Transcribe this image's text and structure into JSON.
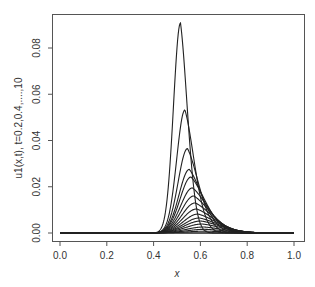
{
  "chart_data": {
    "type": "line",
    "title": "",
    "xlabel": "x",
    "ylabel": "u1(x,t), t=0.2,0.4,....,10",
    "xlim": [
      0,
      1
    ],
    "ylim": [
      0,
      0.092
    ],
    "grid": false,
    "legend": null,
    "x_ticks": [
      "0.0",
      "0.2",
      "0.4",
      "0.6",
      "0.8",
      "1.0"
    ],
    "y_ticks": [
      "0.00",
      "0.02",
      "0.04",
      "0.06",
      "0.08"
    ],
    "line_color": "#222222",
    "series_note": "Family of curves for t = 0.2, 0.4, ..., 10; peak amplitude decreases and peak shifts right as t increases",
    "series": [
      {
        "name": "t=0.2",
        "peak_x": 0.515,
        "peak_y": 0.0908,
        "rise": 0.03,
        "decay": 0.03
      },
      {
        "name": "t=0.4",
        "peak_x": 0.534,
        "peak_y": 0.0532,
        "rise": 0.035,
        "decay": 0.04
      },
      {
        "name": "t=0.6",
        "peak_x": 0.545,
        "peak_y": 0.0365,
        "rise": 0.04,
        "decay": 0.048
      },
      {
        "name": "t=0.8",
        "peak_x": 0.553,
        "peak_y": 0.0275,
        "rise": 0.044,
        "decay": 0.055
      },
      {
        "name": "t=1.0",
        "peak_x": 0.56,
        "peak_y": 0.0242,
        "rise": 0.047,
        "decay": 0.06
      },
      {
        "name": "t=1.2",
        "peak_x": 0.566,
        "peak_y": 0.0195,
        "rise": 0.05,
        "decay": 0.065
      },
      {
        "name": "t=1.4",
        "peak_x": 0.572,
        "peak_y": 0.016,
        "rise": 0.053,
        "decay": 0.069
      },
      {
        "name": "t=1.6",
        "peak_x": 0.578,
        "peak_y": 0.013,
        "rise": 0.056,
        "decay": 0.072
      },
      {
        "name": "t=1.8",
        "peak_x": 0.584,
        "peak_y": 0.0104,
        "rise": 0.059,
        "decay": 0.075
      },
      {
        "name": "t=2.0",
        "peak_x": 0.59,
        "peak_y": 0.0082,
        "rise": 0.062,
        "decay": 0.078
      },
      {
        "name": "t=2.2",
        "peak_x": 0.596,
        "peak_y": 0.0065,
        "rise": 0.065,
        "decay": 0.08
      },
      {
        "name": "t=2.4",
        "peak_x": 0.602,
        "peak_y": 0.0052,
        "rise": 0.068,
        "decay": 0.082
      },
      {
        "name": "t=2.6",
        "peak_x": 0.608,
        "peak_y": 0.0039,
        "rise": 0.071,
        "decay": 0.084
      },
      {
        "name": "t=2.8",
        "peak_x": 0.614,
        "peak_y": 0.0026,
        "rise": 0.074,
        "decay": 0.086
      },
      {
        "name": "t=3.0",
        "peak_x": 0.62,
        "peak_y": 0.0016,
        "rise": 0.077,
        "decay": 0.088
      },
      {
        "name": "t>3",
        "peak_x": 0.625,
        "peak_y": 0.0008,
        "rise": 0.08,
        "decay": 0.09
      }
    ]
  }
}
